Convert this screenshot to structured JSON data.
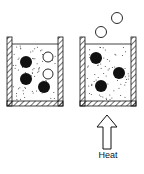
{
  "diagram": {
    "label_heat": "Heat",
    "left_beaker": {
      "description": "liquid with dissolved gas",
      "solid_particles": 3,
      "gas_bubbles_in_liquid": 2,
      "gas_bubbles_escaping": 0
    },
    "right_beaker": {
      "description": "heated liquid releasing gas",
      "solid_particles": 3,
      "gas_bubbles_in_liquid": 0,
      "gas_bubbles_escaping": 2
    },
    "colors": {
      "ink": "#111111",
      "background": "#ffffff"
    }
  }
}
